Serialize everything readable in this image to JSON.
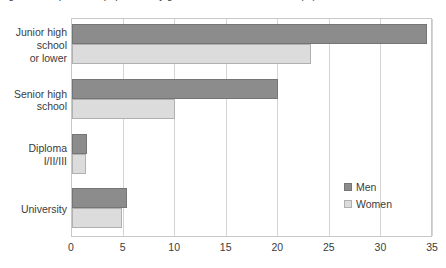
{
  "chart_data": {
    "type": "bar",
    "orientation": "horizontal",
    "title": "Figure 3. Proportion of population by gender and educational level (%)",
    "title_visible": "partially cut off at top edge of image",
    "xlabel": "",
    "ylabel": "",
    "categories": [
      "Junior high school or lower",
      "Senior high school",
      "Diploma I/II/III",
      "University"
    ],
    "series": [
      {
        "name": "Men",
        "color": "#8c8c8c",
        "values": [
          34.4,
          20.0,
          1.5,
          5.3
        ]
      },
      {
        "name": "Women",
        "color": "#dcdcdc",
        "values": [
          23.2,
          10.0,
          1.4,
          4.8
        ]
      }
    ],
    "xlim": [
      0,
      35
    ],
    "xticks": [
      0,
      5,
      10,
      15,
      20,
      25,
      30,
      35
    ],
    "xtick_labels": [
      "0",
      "5",
      "10",
      "15",
      "20",
      "25",
      "30",
      "35"
    ],
    "grid": "vertical",
    "legend_position": "inside-right"
  },
  "ylabels": [
    {
      "lines": [
        "Junior high",
        "school",
        "or lower"
      ]
    },
    {
      "lines": [
        "Senior high",
        "school"
      ]
    },
    {
      "lines": [
        "Diploma",
        "I/II/III"
      ]
    },
    {
      "lines": [
        "University"
      ]
    }
  ],
  "legend": {
    "items": [
      {
        "label": "Men"
      },
      {
        "label": "Women"
      }
    ]
  }
}
